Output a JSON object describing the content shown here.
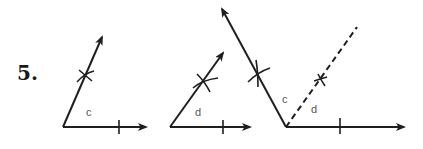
{
  "problem": {
    "number_label": "5."
  },
  "colors": {
    "ink": "#1f1f1f",
    "label": "#555555",
    "background": "#ffffff"
  },
  "figures": [
    {
      "name": "angle-c",
      "label": "c",
      "vertex": [
        63,
        127
      ],
      "base_ray_end": [
        146,
        127
      ],
      "base_tick": [
        119,
        127
      ],
      "side_ray_end": [
        102,
        37
      ],
      "side_cross": [
        85,
        76
      ],
      "label_pos": [
        86,
        116
      ]
    },
    {
      "name": "angle-d",
      "label": "d",
      "vertex": [
        170,
        127
      ],
      "base_ray_end": [
        250,
        127
      ],
      "base_tick": [
        223,
        127
      ],
      "side_ray_end": [
        223,
        53
      ],
      "side_cross": [
        203,
        82
      ],
      "label_pos": [
        195,
        116
      ]
    },
    {
      "name": "angle-c-plus-d",
      "label_c": "c",
      "label_d": "d",
      "vertex": [
        286,
        127
      ],
      "base_ray_end": [
        404,
        127
      ],
      "base_tick": [
        340,
        127
      ],
      "outer_ray_end": [
        222,
        9
      ],
      "outer_cross": [
        258,
        73
      ],
      "dashed_ray_end": [
        357,
        27
      ],
      "dashed_cross": [
        320,
        80
      ],
      "label_c_pos": [
        282,
        103
      ],
      "label_d_pos": [
        311,
        113
      ]
    }
  ]
}
